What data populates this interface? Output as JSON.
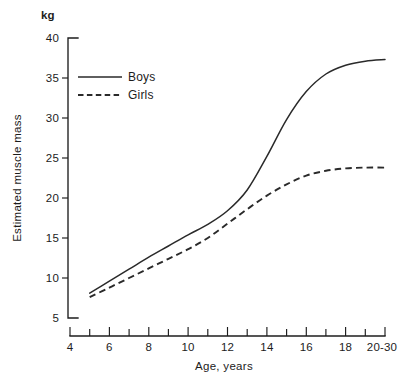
{
  "chart_data": {
    "type": "line",
    "title": "",
    "subtitle": "",
    "xlabel": "Age, years",
    "ylabel": "Estimated muscle mass",
    "yunit": "kg",
    "xlim": [
      4,
      20
    ],
    "ylim": [
      5,
      40
    ],
    "grid": false,
    "legend_position": "upper-left-inside",
    "x_tick_labels": [
      "4",
      "6",
      "8",
      "10",
      "12",
      "14",
      "16",
      "18",
      "20-30"
    ],
    "x_tick_values": [
      4,
      6,
      8,
      10,
      12,
      14,
      16,
      18,
      20
    ],
    "x_minor_tick_values": [
      5,
      7,
      9,
      11,
      13,
      15,
      17,
      19
    ],
    "y_tick_labels": [
      "40",
      "35",
      "30",
      "25",
      "20",
      "15",
      "10",
      "5"
    ],
    "y_tick_values": [
      40,
      35,
      30,
      25,
      20,
      15,
      10,
      5
    ],
    "x": [
      5,
      6,
      7,
      8,
      9,
      10,
      11,
      12,
      13,
      14,
      15,
      16,
      17,
      18,
      19,
      20
    ],
    "series": [
      {
        "name": "Boys",
        "style": "solid",
        "color": "#2a2a2a",
        "values": [
          8.1,
          9.6,
          11.1,
          12.6,
          14.0,
          15.4,
          16.7,
          18.4,
          21.0,
          25.2,
          29.8,
          33.3,
          35.5,
          36.6,
          37.1,
          37.3
        ]
      },
      {
        "name": "Girls",
        "style": "dashed",
        "color": "#2a2a2a",
        "values": [
          7.6,
          8.8,
          10.0,
          11.2,
          12.4,
          13.6,
          15.0,
          16.8,
          18.6,
          20.3,
          21.7,
          22.8,
          23.4,
          23.7,
          23.8,
          23.8
        ]
      }
    ],
    "legend": [
      {
        "label": "Boys",
        "style": "solid"
      },
      {
        "label": "Girls",
        "style": "dashed"
      }
    ]
  }
}
